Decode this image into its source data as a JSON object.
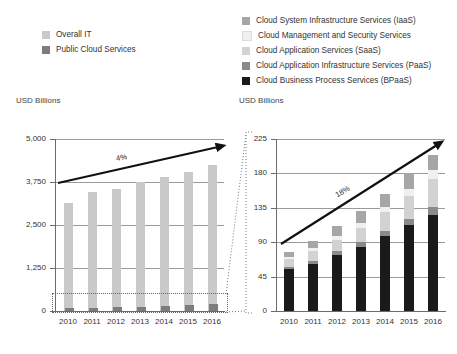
{
  "legend_left": {
    "name": "overall-it-legend",
    "items": [
      {
        "label": "Overall IT",
        "color": "#c9c9c9",
        "icon": "legend-swatch"
      },
      {
        "label": "Public Cloud Services",
        "color": "#7d7d7d",
        "icon": "legend-swatch"
      }
    ]
  },
  "legend_right": {
    "name": "cloud-services-legend",
    "items": [
      {
        "label": "Cloud System Infrastructure Services (IaaS)",
        "color": "#a6a6a6",
        "icon": "legend-swatch"
      },
      {
        "label": "Cloud Management and Security Services",
        "color": "#f0f0f0",
        "icon": "legend-swatch"
      },
      {
        "label": "Cloud Application Services (SaaS)",
        "color": "#d2d2d2",
        "icon": "legend-swatch"
      },
      {
        "label": "Cloud Application Infrastructure Services (PaaS)",
        "color": "#8a8a8a",
        "icon": "legend-swatch"
      },
      {
        "label": "Cloud Business Process Services (BPaaS)",
        "color": "#1a1a1a",
        "icon": "legend-swatch"
      }
    ]
  },
  "left_axis_title": "USD Billions",
  "right_axis_title": "USD Billions",
  "chart_data": [
    {
      "type": "bar",
      "id": "overall-it-chart",
      "title": "",
      "xlabel": "",
      "ylabel": "USD Billions",
      "ylim": [
        0,
        5000
      ],
      "yticks": [
        0,
        1250,
        2500,
        3750,
        5000
      ],
      "ytick_labels": [
        "0",
        "1,250",
        "2,500",
        "3,750",
        "5,000"
      ],
      "grid": true,
      "legend_position": "top-left",
      "categories": [
        "2010",
        "2011",
        "2012",
        "2013",
        "2014",
        "2015",
        "2016"
      ],
      "series": [
        {
          "name": "Overall IT",
          "color": "#c9c9c9",
          "values": [
            3150,
            3450,
            3550,
            3750,
            3900,
            4050,
            4250
          ]
        },
        {
          "name": "Public Cloud Services",
          "color": "#7d7d7d",
          "values": [
            77,
            91,
            111,
            131,
            153,
            180,
            204
          ]
        }
      ],
      "annotations": [
        {
          "text": "4%",
          "type": "cagr-arrow-label"
        }
      ],
      "callout_box": {
        "type": "dotted-rect",
        "encloses": "Public Cloud Services"
      }
    },
    {
      "type": "bar",
      "id": "public-cloud-services-chart",
      "stacked": true,
      "title": "",
      "xlabel": "",
      "ylabel": "USD Billions",
      "ylim": [
        0,
        225
      ],
      "yticks": [
        0,
        45,
        90,
        135,
        180,
        225
      ],
      "ytick_labels": [
        "0",
        "45",
        "90",
        "135",
        "180",
        "225"
      ],
      "grid": true,
      "legend_position": "top-right",
      "categories": [
        "2010",
        "2011",
        "2012",
        "2013",
        "2014",
        "2015",
        "2016"
      ],
      "series": [
        {
          "name": "Cloud Business Process Services (BPaaS)",
          "color": "#1a1a1a",
          "values": [
            55,
            62,
            73,
            84,
            98,
            112,
            125
          ]
        },
        {
          "name": "Cloud Application Infrastructure Services (PaaS)",
          "color": "#8a8a8a",
          "values": [
            3,
            4,
            5,
            6,
            7,
            9,
            11
          ]
        },
        {
          "name": "Cloud Application Services (SaaS)",
          "color": "#d2d2d2",
          "values": [
            10,
            12,
            15,
            19,
            24,
            30,
            37
          ]
        },
        {
          "name": "Cloud Management and Security Services",
          "color": "#f0f0f0",
          "values": [
            3,
            4,
            5,
            6,
            7,
            9,
            11
          ]
        },
        {
          "name": "Cloud System Infrastructure Services (IaaS)",
          "color": "#a6a6a6",
          "values": [
            6,
            9,
            13,
            16,
            17,
            20,
            20
          ]
        }
      ],
      "annotations": [
        {
          "text": "18%",
          "type": "cagr-arrow-label"
        }
      ]
    }
  ]
}
